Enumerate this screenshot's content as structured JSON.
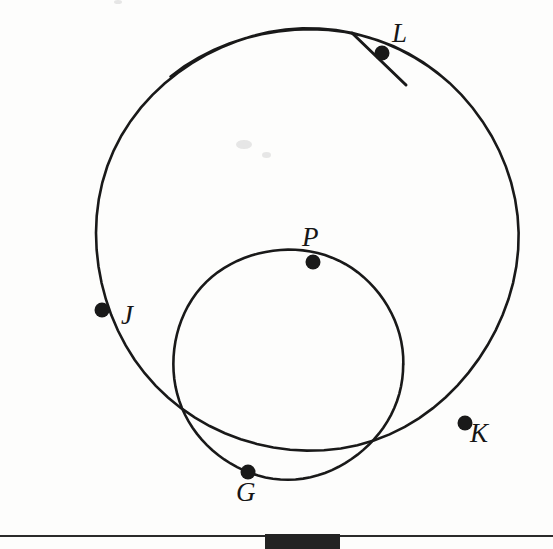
{
  "figure": {
    "background_color": "#fdfdfc",
    "stroke_color": "#191919",
    "width": 553,
    "height": 549
  },
  "chart_data": {
    "type": "diagram",
    "circles": [
      {
        "name": "large-circle",
        "center_x": 307,
        "center_y": 239,
        "radius": 211,
        "arc_start_deg": 130,
        "arc_end_deg": 50,
        "points_on_circle": [
          "J",
          "L",
          "K"
        ]
      },
      {
        "name": "small-circle",
        "center_x": 288,
        "center_y": 364,
        "radius": 115,
        "arc_start_deg": 0,
        "arc_end_deg": 360,
        "points_on_circle": [
          "J",
          "P",
          "K",
          "G"
        ]
      }
    ],
    "points": [
      {
        "id": "L",
        "label": "L",
        "x": 382,
        "y": 53,
        "label_x": 392,
        "label_y": 22,
        "on": [
          "large-circle",
          "secant-line"
        ]
      },
      {
        "id": "P",
        "label": "P",
        "x": 313,
        "y": 262,
        "label_x": 302,
        "label_y": 226,
        "on": [
          "small-circle"
        ]
      },
      {
        "id": "J",
        "label": "J",
        "x": 102,
        "y": 310,
        "label_x": 120,
        "label_y": 303,
        "on": [
          "large-circle",
          "small-circle"
        ]
      },
      {
        "id": "K",
        "label": "K",
        "x": 465,
        "y": 423,
        "label_x": 470,
        "label_y": 422,
        "on": [
          "large-circle",
          "small-circle"
        ]
      },
      {
        "id": "G",
        "label": "G",
        "x": 248,
        "y": 472,
        "label_x": 236,
        "label_y": 481,
        "on": [
          "small-circle"
        ]
      }
    ],
    "segments": [
      {
        "name": "secant-line-through-L",
        "x1": 352,
        "y1": 33,
        "x2": 406,
        "y2": 85,
        "passes_through": "L"
      }
    ],
    "dot_radius": 7.5,
    "axis_ranges": {
      "x": [
        0,
        553
      ],
      "y": [
        0,
        549
      ]
    },
    "grid": false,
    "legend": false
  },
  "footer": {
    "rule_y": 535,
    "rule_color": "#2a2a2a",
    "block": {
      "x": 265,
      "y": 534,
      "width": 75,
      "height": 15,
      "color": "#232323"
    }
  }
}
